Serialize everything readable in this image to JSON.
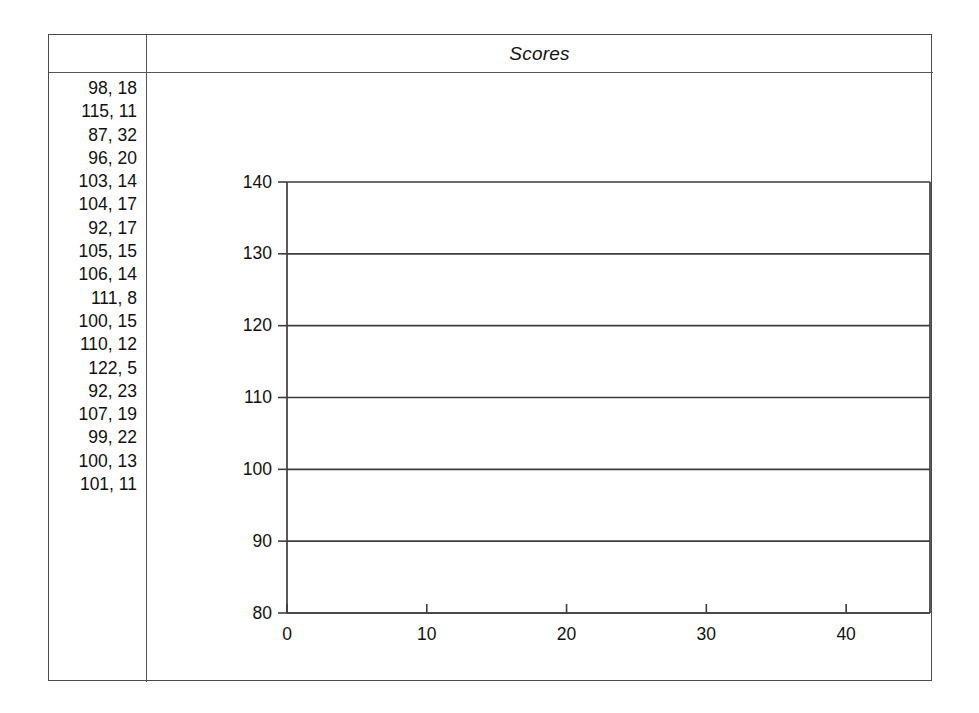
{
  "document": {
    "header": {
      "title": "Scores"
    }
  },
  "data_list": {
    "name": "scores-pairs-list",
    "rows": [
      "98, 18",
      "115, 11",
      "87, 32",
      "96, 20",
      "103, 14",
      "104, 17",
      "92, 17",
      "105, 15",
      "106, 14",
      "111, 8",
      "100, 15",
      "110, 12",
      "122, 5",
      "92, 23",
      "107, 19",
      "99, 22",
      "100, 13",
      "101, 11"
    ]
  },
  "chart_data": {
    "type": "scatter",
    "title": "Scores",
    "xlabel": "",
    "ylabel": "",
    "xlim": [
      0,
      46
    ],
    "ylim": [
      80,
      140
    ],
    "xticks": [
      0,
      10,
      20,
      30,
      40
    ],
    "xticklabels": [
      "0",
      "10",
      "20",
      "30",
      "40"
    ],
    "yticks": [
      80,
      90,
      100,
      110,
      120,
      130,
      140
    ],
    "yticklabels": [
      "80",
      "90",
      "100",
      "110",
      "120",
      "130",
      "140"
    ],
    "grid": "horizontal",
    "legend": "none",
    "series": [
      {
        "name": "Scores",
        "rendered": false,
        "x": [
          98,
          115,
          87,
          96,
          103,
          104,
          92,
          105,
          106,
          111,
          100,
          110,
          122,
          92,
          107,
          99,
          100,
          101
        ],
        "y": [
          18,
          11,
          32,
          20,
          14,
          17,
          17,
          15,
          14,
          8,
          15,
          12,
          5,
          23,
          19,
          22,
          13,
          11
        ]
      }
    ],
    "note": "plot area is empty; only axes and horizontal gridlines are drawn"
  },
  "colors": {
    "frame": "#4a4a4a",
    "rule": "#555555",
    "axis": "#3d3d3d",
    "text": "#111111",
    "background": "#ffffff"
  }
}
